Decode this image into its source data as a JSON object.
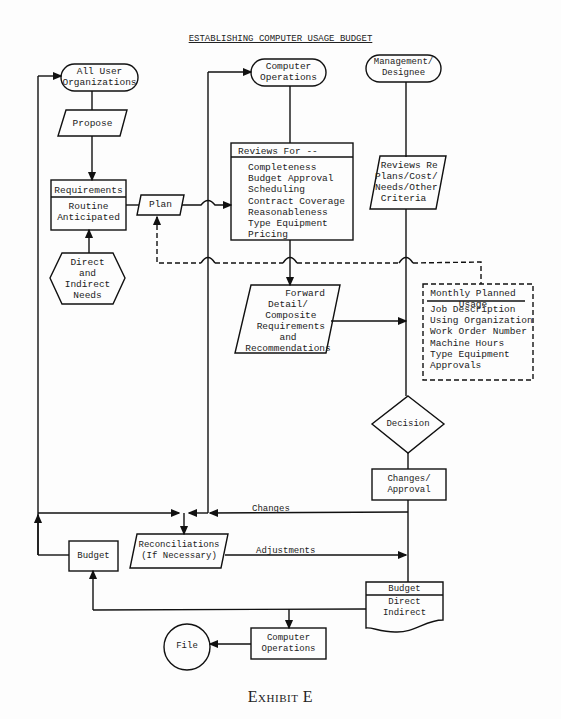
{
  "title": "ESTABLISHING COMPUTER USAGE BUDGET",
  "caption": "Exhibit E",
  "nodes": {
    "all_user_orgs": {
      "line1": "All User",
      "line2": "Organizations"
    },
    "propose": "Propose",
    "requirements": {
      "header": "Requirements",
      "line1": "Routine",
      "line2": "Anticipated"
    },
    "needs": {
      "line1": "Direct",
      "line2": "and",
      "line3": "Indirect",
      "line4": "Needs"
    },
    "plan": "Plan",
    "computer_ops_top": {
      "line1": "Computer",
      "line2": "Operations"
    },
    "management": {
      "line1": "Management/",
      "line2": "Designee"
    },
    "reviews_for": {
      "header": "Reviews For --",
      "items": [
        "Completeness",
        "Budget Approval",
        "Scheduling",
        "Contract Coverage",
        "Reasonableness",
        "Type Equipment",
        "Pricing"
      ]
    },
    "reviews_re": {
      "line1": "Reviews Re",
      "line2": "Plans/Cost/",
      "line3": "Needs/Other",
      "line4": "Criteria"
    },
    "forward": {
      "line1": "Forward",
      "line2": "Detail/",
      "line3": "Composite",
      "line4": "Requirements",
      "line5": "and",
      "line6": "Recommendations"
    },
    "monthly": {
      "header1": "Monthly Planned",
      "header2": "Usage",
      "items": [
        "Job Description",
        "Using Organization",
        "Work Order Number",
        "Machine Hours",
        "Type Equipment",
        "Approvals"
      ]
    },
    "decision": "Decision",
    "changes_approval": {
      "line1": "Changes/",
      "line2": "Approval"
    },
    "reconciliations": {
      "line1": "Reconciliations",
      "line2": "(If Necessary)"
    },
    "budget_left": "Budget",
    "budget_doc": {
      "header": "Budget",
      "line1": "Direct",
      "line2": "Indirect"
    },
    "computer_ops_bottom": {
      "line1": "Computer",
      "line2": "Operations"
    },
    "file": "File"
  },
  "edge_labels": {
    "changes": "Changes",
    "adjustments": "Adjustments"
  }
}
